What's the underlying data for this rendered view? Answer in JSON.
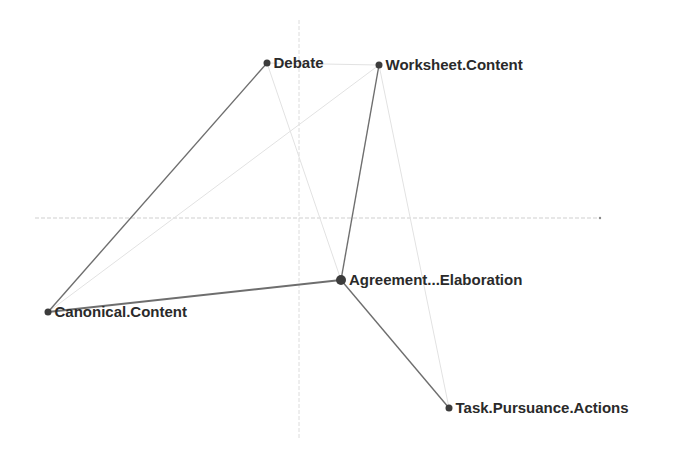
{
  "diagram": {
    "type": "network-plot",
    "axes": {
      "horizontal": {
        "x1": 35,
        "y": 218,
        "x2": 600,
        "color": "#cfcfcf"
      },
      "vertical": {
        "x": 299,
        "y1": 20,
        "y2": 440,
        "color": "#dcdcdc"
      }
    },
    "colors": {
      "strong_edge": "#6e6e6e",
      "faint_edge": "#e2e2e2",
      "node": "#3c3c3c",
      "label": "#2a2a2a"
    },
    "nodes": [
      {
        "id": "debate",
        "label": "Debate",
        "x": 267,
        "y": 63,
        "r": 3.5
      },
      {
        "id": "worksheet",
        "label": "Worksheet.Content",
        "x": 379,
        "y": 65,
        "r": 3.5
      },
      {
        "id": "agreement",
        "label": "Agreement...Elaboration",
        "x": 341,
        "y": 280,
        "r": 5
      },
      {
        "id": "canonical",
        "label": "Canonical.Content",
        "x": 48,
        "y": 312,
        "r": 3.5
      },
      {
        "id": "task",
        "label": "Task.Pursuance.Actions",
        "x": 449,
        "y": 408,
        "r": 3.5
      }
    ],
    "edges": [
      {
        "from": "debate",
        "to": "canonical",
        "strength": "strong",
        "width": 1.4
      },
      {
        "from": "canonical",
        "to": "agreement",
        "strength": "strong",
        "width": 2
      },
      {
        "from": "worksheet",
        "to": "agreement",
        "strength": "strong",
        "width": 1.4
      },
      {
        "from": "agreement",
        "to": "task",
        "strength": "strong",
        "width": 1.4
      },
      {
        "from": "debate",
        "to": "worksheet",
        "strength": "faint",
        "width": 1
      },
      {
        "from": "worksheet",
        "to": "canonical",
        "strength": "faint",
        "width": 1
      },
      {
        "from": "worksheet",
        "to": "task",
        "strength": "faint",
        "width": 1
      },
      {
        "from": "debate",
        "to": "agreement",
        "strength": "faint",
        "width": 1
      }
    ]
  }
}
